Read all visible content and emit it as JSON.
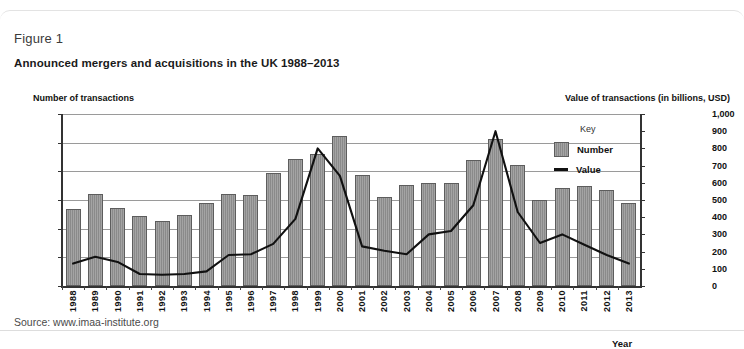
{
  "figure": {
    "label": "Figure 1",
    "title": "Announced mergers and acquisitions in the UK 1988–2013",
    "source": "Source: www.imaa-institute.org"
  },
  "legend": {
    "title": "Key",
    "number_label": "Number",
    "value_label": "Value"
  },
  "axes": {
    "left_title": "Number of transactions",
    "right_title": "Value of transactions (in billions, USD)",
    "x_title": "Year"
  },
  "colors": {
    "bar_fill": "#8a8a8a",
    "bar_stroke": "#5d5d5d",
    "line": "#111111",
    "gridline": "#9a9a9a",
    "panel_bg": "#ffffff",
    "text": "#111111"
  },
  "chart_data": {
    "type": "bar",
    "title": "Announced mergers and acquisitions in the UK 1988–2013",
    "xlabel": "Year",
    "ylabel": "Number of transactions",
    "y2label": "Value of transactions (in billions, USD)",
    "ylim": [
      0,
      6000
    ],
    "y2lim": [
      0,
      1000
    ],
    "yticks": [
      "0",
      "1,000",
      "2,000",
      "3,000",
      "4,000",
      "5,000",
      "6,000"
    ],
    "ytick_values": [
      0,
      1000,
      2000,
      3000,
      4000,
      5000,
      6000
    ],
    "y2ticks": [
      "0",
      "100",
      "200",
      "300",
      "400",
      "500",
      "600",
      "700",
      "800",
      "900",
      "1,000"
    ],
    "y2tick_values": [
      0,
      100,
      200,
      300,
      400,
      500,
      600,
      700,
      800,
      900,
      1000
    ],
    "grid": true,
    "legend_position": "right",
    "categories": [
      "1988",
      "1989",
      "1990",
      "1991",
      "1992",
      "1993",
      "1994",
      "1995",
      "1996",
      "1997",
      "1998",
      "1999",
      "2000",
      "2001",
      "2002",
      "2003",
      "2004",
      "2005",
      "2006",
      "2007",
      "2008",
      "2009",
      "2010",
      "2011",
      "2012",
      "2013"
    ],
    "series": [
      {
        "name": "Number",
        "type": "bar",
        "axis": "left",
        "unit": "transactions",
        "values": [
          2670,
          3220,
          2710,
          2430,
          2270,
          2490,
          2890,
          3220,
          3160,
          3930,
          4430,
          4600,
          5230,
          3880,
          3110,
          3520,
          3590,
          3610,
          4400,
          5130,
          4220,
          3010,
          3420,
          3490,
          3340,
          2890
        ]
      },
      {
        "name": "Value",
        "type": "line",
        "axis": "right",
        "unit": "billions USD",
        "values": [
          130,
          170,
          140,
          70,
          65,
          70,
          85,
          180,
          185,
          245,
          390,
          800,
          640,
          230,
          205,
          185,
          300,
          320,
          470,
          900,
          430,
          250,
          300,
          240,
          180,
          130
        ]
      }
    ]
  }
}
